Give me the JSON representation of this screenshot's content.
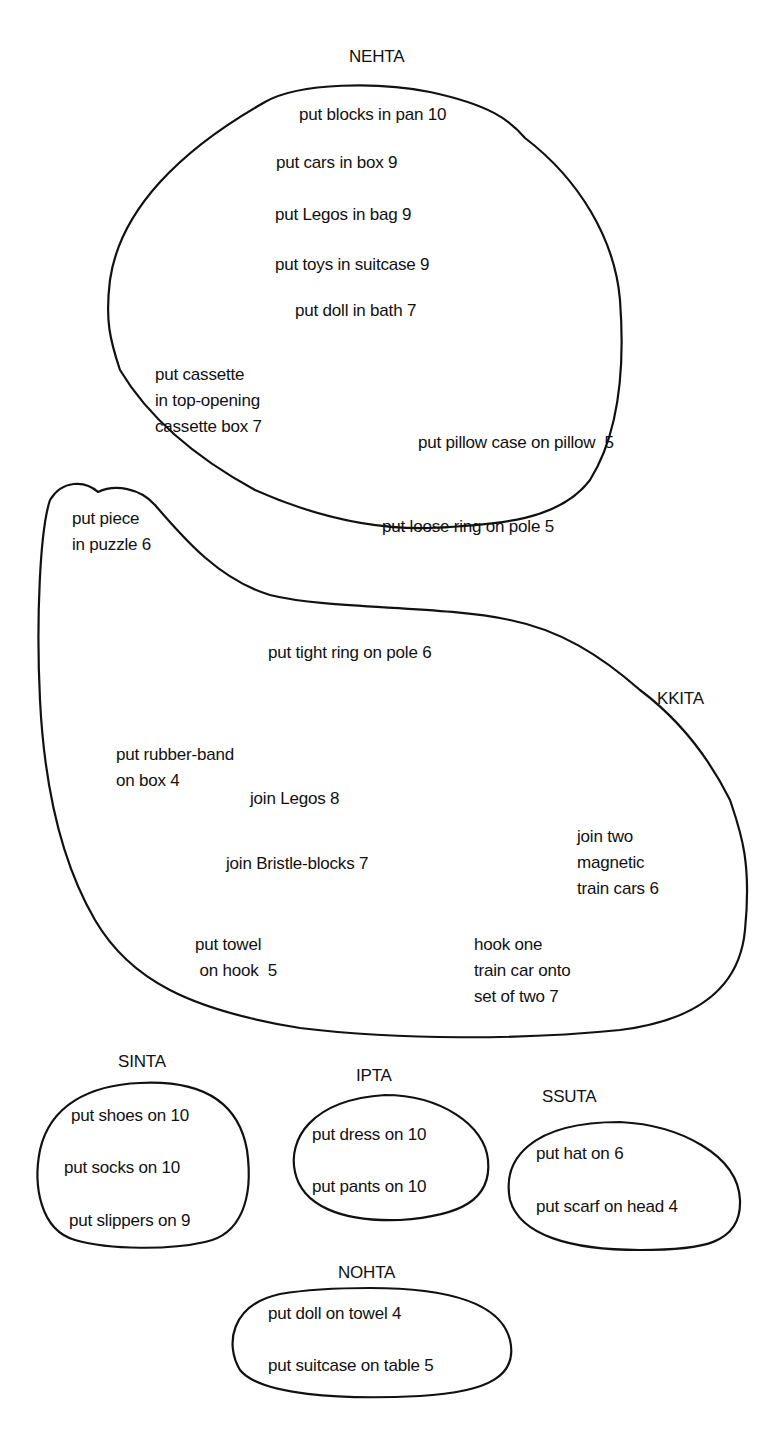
{
  "colors": {
    "ink": "#111111",
    "background": "#ffffff"
  },
  "groups": [
    {
      "name": "NEHTA",
      "items": [
        "put blocks in pan 10",
        "put cars in box 9",
        "put Legos in bag 9",
        "put toys in suitcase 9",
        "put doll in bath 7",
        "put cassette\nin top-opening\ncassette box 7",
        "put pillow case on pillow  5",
        "put loose ring on pole 5"
      ]
    },
    {
      "name": "KKITA",
      "items": [
        "put piece\nin puzzle 6",
        "put tight ring on pole 6",
        "put rubber-band\non box 4",
        "join Legos 8",
        "join two\nmagnetic\ntrain cars 6",
        "join Bristle-blocks 7",
        "put towel\n on hook  5",
        "hook one\ntrain car onto\nset of two 7"
      ]
    },
    {
      "name": "SINTA",
      "items": [
        "put shoes on 10",
        "put socks on 10",
        "put slippers on 9"
      ]
    },
    {
      "name": "IPTA",
      "items": [
        "put dress on 10",
        "put pants on 10"
      ]
    },
    {
      "name": "SSUTA",
      "items": [
        "put hat on 6",
        "put scarf on head 4"
      ]
    },
    {
      "name": "NOHTA",
      "items": [
        "put doll on towel 4",
        "put suitcase on table 5"
      ]
    }
  ]
}
